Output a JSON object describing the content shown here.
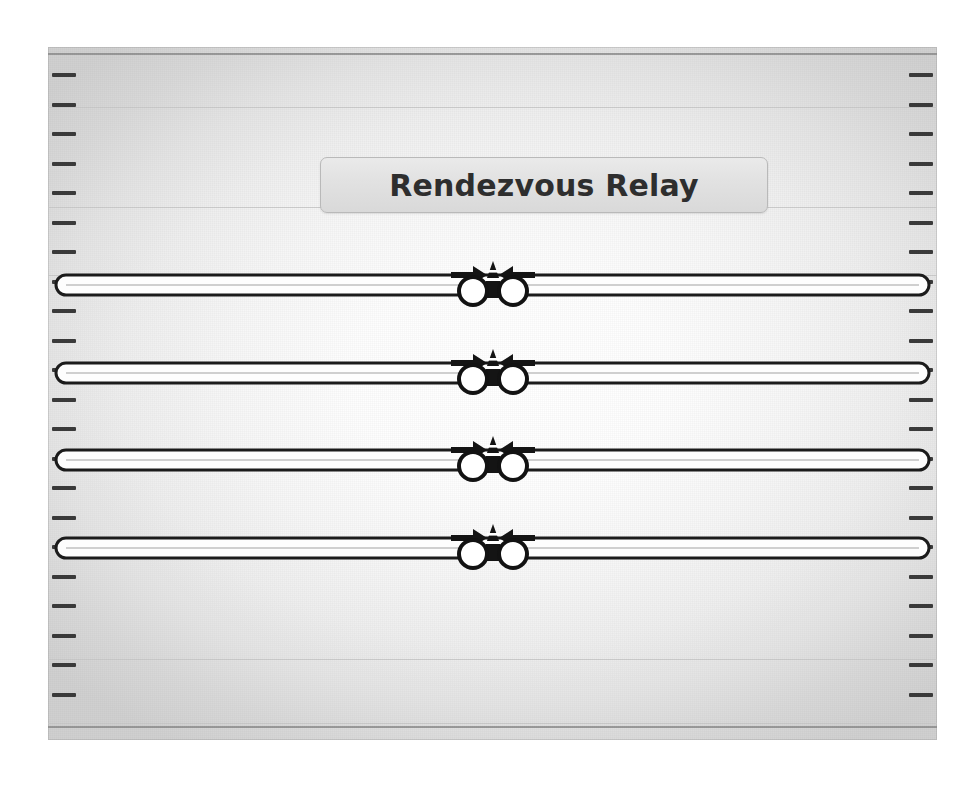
{
  "app": {
    "title": "Rendezvous Relay",
    "background_color": "#ffffff"
  },
  "canvas": {
    "name": "playfield",
    "left": 48,
    "top": 47,
    "width": 889,
    "height": 693,
    "edge_color": "#d0d0d0",
    "center_color": "#ffffff",
    "rule_color": "#8e8e8e"
  },
  "title_plate": {
    "label": "Rendezvous Relay",
    "fill_color": "#e2e2e2",
    "border_color": "#b9b9b9",
    "text_color": "#2e2e2e"
  },
  "gridlines": {
    "color": "#c9c9c9",
    "y_positions": [
      60,
      160,
      228,
      612,
      676
    ]
  },
  "ruler": {
    "tick_color": "#3b3b3b",
    "tick_count": 22,
    "tick_start_y": 26,
    "tick_spacing": 29.5,
    "sides": [
      "left",
      "right"
    ]
  },
  "lanes": [
    {
      "id": "lane-1",
      "label": "Lane 1",
      "y": 236,
      "track_color": "#1b1b1b",
      "track_fill": "#fdfdfd",
      "runner_left_label": "Runner A",
      "runner_right_label": "Runner B",
      "marker_label": "Cone",
      "arrow_left_label": "Approach Right",
      "arrow_right_label": "Approach Left"
    },
    {
      "id": "lane-2",
      "label": "Lane 2",
      "y": 324,
      "track_color": "#1b1b1b",
      "track_fill": "#fdfdfd",
      "runner_left_label": "Runner A",
      "runner_right_label": "Runner B",
      "marker_label": "Cone",
      "arrow_left_label": "Approach Right",
      "arrow_right_label": "Approach Left"
    },
    {
      "id": "lane-3",
      "label": "Lane 3",
      "y": 411,
      "track_color": "#1b1b1b",
      "track_fill": "#fdfdfd",
      "runner_left_label": "Runner A",
      "runner_right_label": "Runner B",
      "marker_label": "Cone",
      "arrow_left_label": "Approach Right",
      "arrow_right_label": "Approach Left"
    },
    {
      "id": "lane-4",
      "label": "Lane 4",
      "y": 499,
      "track_color": "#1b1b1b",
      "track_fill": "#fdfdfd",
      "runner_left_label": "Runner A",
      "runner_right_label": "Runner B",
      "marker_label": "Cone",
      "arrow_left_label": "Approach Right",
      "arrow_right_label": "Approach Left"
    }
  ],
  "runner": {
    "radius": 14,
    "stroke_color": "#121212",
    "fill_color": "#ffffff",
    "stroke_width": 4
  },
  "cone": {
    "body_color": "#141414",
    "stripe_color": "#ffffff",
    "base_color": "#141414"
  },
  "arrow": {
    "color": "#141414"
  }
}
